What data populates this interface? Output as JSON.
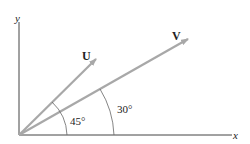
{
  "diagram": {
    "axes": {
      "x_label": "x",
      "y_label": "y"
    },
    "vectors": [
      {
        "name": "U",
        "angle_label": "45°",
        "angle_deg": 45
      },
      {
        "name": "V",
        "angle_label": "30°",
        "angle_deg": 30
      }
    ],
    "colors": {
      "axis": "#444444",
      "vector": "#a8a8a8",
      "arc": "#666666",
      "text": "#222222"
    }
  }
}
